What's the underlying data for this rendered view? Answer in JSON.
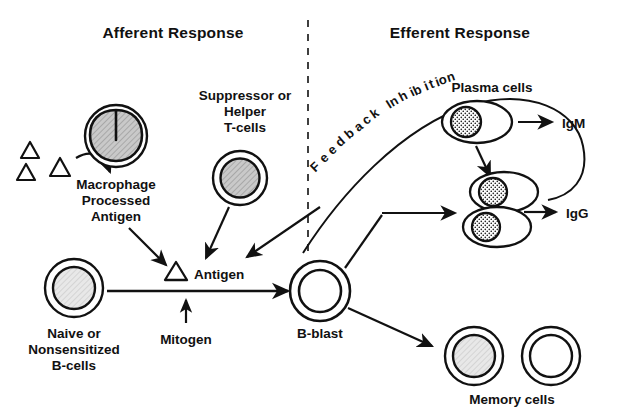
{
  "diagram": {
    "title_afferent": "Afferent Response",
    "title_efferent": "Efferent Response",
    "divider": "vertical-dashed-divider"
  },
  "afferent": {
    "antigen_particles_label": "antigen-triangles",
    "macrophage_label_line1": "Macrophage",
    "macrophage_label_line2": "Processed",
    "macrophage_label_line3": "Antigen",
    "tcell_label_line1": "Suppressor or",
    "tcell_label_line2": "Helper",
    "tcell_label_line3": "T-cells",
    "naive_label_line1": "Naive or",
    "naive_label_line2": "Nonsensitized",
    "naive_label_line3": "B-cells",
    "antigen_label": "Antigen",
    "mitogen_label": "Mitogen"
  },
  "center": {
    "bblast_label": "B-blast"
  },
  "efferent": {
    "feedback_label": "Feedback Inhibition",
    "plasma_cells_label": "Plasma cells",
    "igm_label": "IgM",
    "igg_label": "IgG",
    "memory_cells_label": "Memory cells"
  },
  "feedback_letters": [
    {
      "ch": "F",
      "x": 318,
      "y": 170,
      "rot": -44
    },
    {
      "ch": "e",
      "x": 327,
      "y": 161,
      "rot": -43
    },
    {
      "ch": "e",
      "x": 335,
      "y": 153,
      "rot": -42
    },
    {
      "ch": "d",
      "x": 343,
      "y": 145,
      "rot": -41
    },
    {
      "ch": "b",
      "x": 352,
      "y": 137,
      "rot": -40
    },
    {
      "ch": "a",
      "x": 361,
      "y": 130,
      "rot": -38
    },
    {
      "ch": "c",
      "x": 369,
      "y": 123,
      "rot": -36
    },
    {
      "ch": "k",
      "x": 377,
      "y": 117,
      "rot": -35
    },
    {
      "ch": " ",
      "x": 385,
      "y": 112,
      "rot": -33
    },
    {
      "ch": "I",
      "x": 391,
      "y": 108,
      "rot": -32
    },
    {
      "ch": "n",
      "x": 396,
      "y": 105,
      "rot": -30
    },
    {
      "ch": "h",
      "x": 405,
      "y": 100,
      "rot": -28
    },
    {
      "ch": "i",
      "x": 414,
      "y": 96,
      "rot": -26
    },
    {
      "ch": "b",
      "x": 419,
      "y": 94,
      "rot": -25
    },
    {
      "ch": "i",
      "x": 428,
      "y": 90,
      "rot": -23
    },
    {
      "ch": "t",
      "x": 433,
      "y": 88,
      "rot": -22
    },
    {
      "ch": "i",
      "x": 439,
      "y": 86,
      "rot": -21
    },
    {
      "ch": "o",
      "x": 444,
      "y": 84,
      "rot": -20
    },
    {
      "ch": "n",
      "x": 452,
      "y": 81,
      "rot": -18
    }
  ],
  "colors": {
    "ink": "#111111",
    "nucleus_hatch": "#bdbdbd",
    "nucleus_light": "#e4e4e4",
    "background": "#ffffff"
  }
}
